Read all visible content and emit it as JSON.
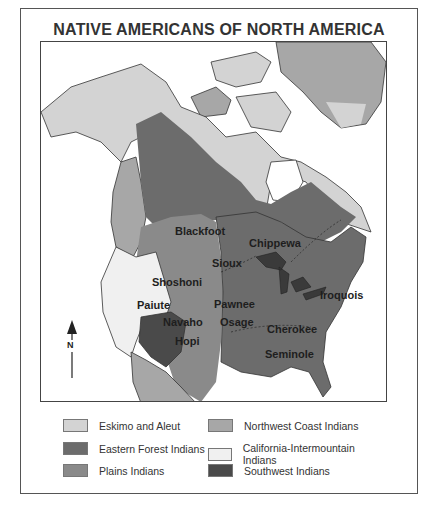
{
  "map": {
    "title": "NATIVE AMERICANS OF NORTH AMERICA",
    "compass": {
      "label": "N"
    },
    "colors": {
      "eskimo_aleut": "#d3d3d3",
      "northwest_coast": "#a7a7a7",
      "eastern_forest": "#6c6c6c",
      "california_intermountain": "#f0f0f0",
      "plains": "#8a8a8a",
      "southwest": "#4a4a4a",
      "water": "#ffffff",
      "outline": "#333333"
    },
    "labels": {
      "blackfoot": "Blackfoot",
      "chippewa": "Chippewa",
      "sioux": "Sioux",
      "shoshoni": "Shoshoni",
      "paiute": "Paiute",
      "pawnee": "Pawnee",
      "navaho": "Navaho",
      "osage": "Osage",
      "hopi": "Hopi",
      "cherokee": "Cherokee",
      "iroquois": "Iroquois",
      "seminole": "Seminole"
    }
  },
  "legend": {
    "items": [
      {
        "label": "Eskimo and Aleut",
        "color": "#d3d3d3"
      },
      {
        "label": "Northwest Coast Indians",
        "color": "#a7a7a7"
      },
      {
        "label": "Eastern Forest Indians",
        "color": "#6c6c6c"
      },
      {
        "label": "California-Intermountain Indians",
        "color": "#f0f0f0"
      },
      {
        "label": "Plains Indians",
        "color": "#8a8a8a"
      },
      {
        "label": "Southwest Indians",
        "color": "#4a4a4a"
      }
    ]
  }
}
